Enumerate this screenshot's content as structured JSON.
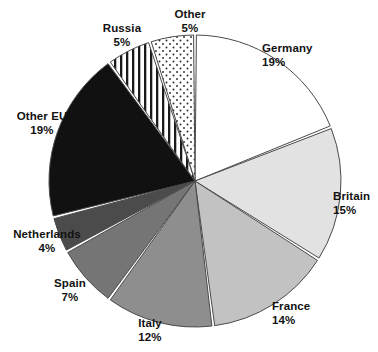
{
  "chart_data": {
    "type": "pie",
    "title": "",
    "subtitle": "",
    "xlabel": "",
    "ylabel": "",
    "legend_position": "none",
    "grid": false,
    "units": "percent",
    "start_angle_deg": 0,
    "direction": "clockwise",
    "categories": [
      "Germany",
      "Britain",
      "France",
      "Italy",
      "Spain",
      "Netherlands",
      "Other EU",
      "Russia",
      "Other"
    ],
    "values": [
      19,
      15,
      14,
      12,
      7,
      4,
      19,
      5,
      5
    ],
    "total": 100,
    "slices": [
      {
        "label": "Germany",
        "value": 19,
        "pct_text": "19%",
        "fill": "#ffffff",
        "pattern": "solid",
        "label_align": "left",
        "label_x": 262,
        "label_y": 42
      },
      {
        "label": "Britain",
        "value": 15,
        "pct_text": "15%",
        "fill": "#e2e2e2",
        "pattern": "solid",
        "label_align": "left",
        "label_x": 333,
        "label_y": 190
      },
      {
        "label": "France",
        "value": 14,
        "pct_text": "14%",
        "fill": "#c2c2c2",
        "pattern": "solid",
        "label_align": "left",
        "label_x": 272,
        "label_y": 300
      },
      {
        "label": "Italy",
        "value": 12,
        "pct_text": "12%",
        "fill": "#8e8e8e",
        "pattern": "solid",
        "label_align": "center",
        "label_x": 150,
        "label_y": 317
      },
      {
        "label": "Spain",
        "value": 7,
        "pct_text": "7%",
        "fill": "#757575",
        "pattern": "solid",
        "label_align": "center",
        "label_x": 70,
        "label_y": 277
      },
      {
        "label": "Netherlands",
        "value": 4,
        "pct_text": "4%",
        "fill": "#4b4b4b",
        "pattern": "solid",
        "label_align": "center",
        "label_x": 47,
        "label_y": 228
      },
      {
        "label": "Other EU",
        "value": 19,
        "pct_text": "19%",
        "fill": "#111111",
        "pattern": "solid",
        "label_align": "center",
        "label_x": 42,
        "label_y": 110
      },
      {
        "label": "Russia",
        "value": 5,
        "pct_text": "5%",
        "fill": "#ffffff",
        "pattern": "vertical-stripes",
        "label_align": "center",
        "label_x": 122,
        "label_y": 22
      },
      {
        "label": "Other",
        "value": 5,
        "pct_text": "5%",
        "fill": "#ffffff",
        "pattern": "dots",
        "label_align": "center",
        "label_x": 190,
        "label_y": 8
      }
    ],
    "geometry": {
      "cx": 195,
      "cy": 181,
      "r": 146,
      "gap_deg": 1.1
    },
    "colors": {
      "outline": "#4a4a4a",
      "separator": "#ffffff",
      "background": "#ffffff",
      "text": "#121212"
    }
  }
}
